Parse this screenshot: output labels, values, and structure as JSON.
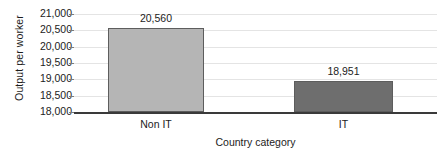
{
  "chart_data": {
    "type": "bar",
    "title": "",
    "categories": [
      "Non IT",
      "IT"
    ],
    "values": [
      20560,
      18951
    ],
    "value_labels": [
      "20,560",
      "18,951"
    ],
    "xlabel": "Country category",
    "ylabel": "Output per worker",
    "ylim": [
      18000,
      21000
    ],
    "ytick_step": 500,
    "yticks": [
      21000,
      20500,
      20000,
      19500,
      19000,
      18500,
      18000
    ],
    "ytick_labels": [
      "21,000",
      "20,500",
      "20,000",
      "19,500",
      "19,000",
      "18,500",
      "18,000"
    ],
    "grid": true,
    "legend": false,
    "legend_position": "none",
    "series": [
      {
        "name": "Output per worker",
        "values": [
          20560,
          18951
        ],
        "bar_colors": [
          "#b5b5b5",
          "#6e6e6e"
        ]
      }
    ],
    "colors": {
      "bar_non_it": "#b5b5b5",
      "bar_it": "#6e6e6e",
      "bar_border": "#5d5d5d",
      "gridline": "#e4e4e4",
      "axis": "#3a3a3a",
      "text": "#1c1c1c",
      "background": "#ffffff"
    }
  }
}
